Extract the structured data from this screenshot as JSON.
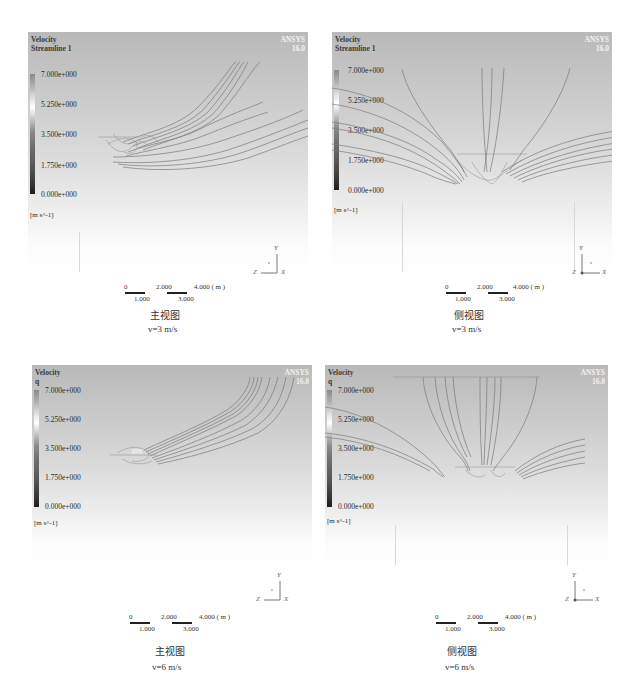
{
  "panels": [
    {
      "id": "front-3",
      "title_line1": "Velocity",
      "title_line2": "Streamline 1",
      "brand": "ANSYS",
      "version": "16.0",
      "colorbar": {
        "ticks": [
          "7.000e+000",
          "5.250e+000",
          "3.500e+000",
          "1.750e+000",
          "0.000e+000"
        ],
        "unit": "[m s^-1]"
      },
      "scale": {
        "top": [
          "0",
          "2.000",
          "4.000 ( m )"
        ],
        "bottom": [
          "1.000",
          "3.000"
        ]
      },
      "axes": {
        "y": "Y",
        "z": "Z",
        "x": "X"
      },
      "caption": "主视图",
      "speed": "v=3 m/s"
    },
    {
      "id": "side-3",
      "title_line1": "Velocity",
      "title_line2": "Streamline 1",
      "brand": "ANSYS",
      "version": "16.0",
      "colorbar": {
        "ticks": [
          "7.000e+000",
          "5.250e+000",
          "3.500e+000",
          "1.750e+000",
          "0.000e+000"
        ],
        "unit": "[m s^-1]"
      },
      "scale": {
        "top": [
          "0",
          "2.000",
          "4.000 ( m )"
        ],
        "bottom": [
          "1.000",
          "3.000"
        ]
      },
      "axes": {
        "y": "Y",
        "z": "Z",
        "x": "X"
      },
      "caption": "侧视图",
      "speed": "v=3 m/s"
    },
    {
      "id": "front-6",
      "title_line1": "Velocity",
      "title_line2": "q",
      "brand": "ANSYS",
      "version": "16.0",
      "colorbar": {
        "ticks": [
          "7.000e+000",
          "5.250e+000",
          "3.500e+000",
          "1.750e+000",
          "0.000e+000"
        ],
        "unit": "[m s^-1]"
      },
      "scale": {
        "top": [
          "0",
          "2.000",
          "4.000 ( m )"
        ],
        "bottom": [
          "1.000",
          "3.000"
        ]
      },
      "axes": {
        "y": "Y",
        "z": "Z",
        "x": "X"
      },
      "caption": "主视图",
      "speed": "v=6 m/s"
    },
    {
      "id": "side-6",
      "title_line1": "Velocity",
      "title_line2": "q",
      "brand": "ANSYS",
      "version": "16.0",
      "colorbar": {
        "ticks": [
          "7.000e+000",
          "5.250e+000",
          "3.500e+000",
          "1.750e+000",
          "0.000e+000"
        ],
        "unit": "[m s^-1]"
      },
      "scale": {
        "top": [
          "0",
          "2.000",
          "4.000 ( m )"
        ],
        "bottom": [
          "1.000",
          "3.000"
        ]
      },
      "axes": {
        "y": "Y",
        "z": "Z",
        "x": "X"
      },
      "caption": "侧视图",
      "speed": "v=6 m/s"
    }
  ],
  "colors": {
    "viewport_top": "#b9b9b9",
    "viewport_bottom": "#ffffff",
    "streamline": "#7a7a7a",
    "brand_text": "#f3f3f3"
  }
}
